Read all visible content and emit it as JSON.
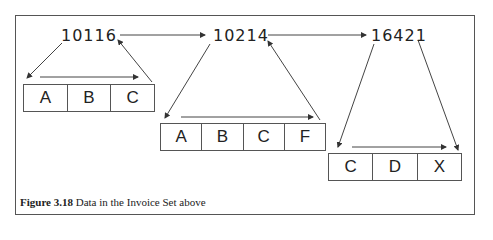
{
  "figure": {
    "caption_label": "Figure 3.18",
    "caption_text": " Data in the Invoice Set above"
  },
  "owners": [
    {
      "id": "10116"
    },
    {
      "id": "10214"
    },
    {
      "id": "16421"
    }
  ],
  "sets": [
    {
      "members": [
        "A",
        "B",
        "C"
      ]
    },
    {
      "members": [
        "A",
        "B",
        "C",
        "F"
      ]
    },
    {
      "members": [
        "C",
        "D",
        "X"
      ]
    }
  ],
  "colors": {
    "line": "#555555",
    "text": "#222222",
    "background": "#ffffff"
  }
}
